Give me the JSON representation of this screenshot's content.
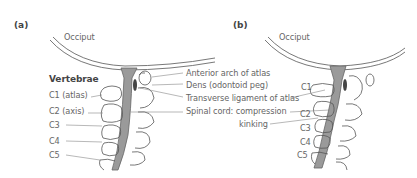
{
  "panels": [
    {
      "id": "a",
      "label": "(a)",
      "occiput": "Occiput",
      "vertebrae_heading": "Vertebrae",
      "vertebrae": [
        "C1 (atlas)",
        "C2 (axis)",
        "C3",
        "C4",
        "C5"
      ],
      "annotations": [
        "Anterior arch of atlas",
        "Dens (odontoid peg)",
        "Transverse ligament of atlas",
        "Spinal cord: compression",
        "kinking"
      ]
    },
    {
      "id": "b",
      "label": "(b)",
      "occiput": "Occiput",
      "vertebrae": [
        "C1",
        "C2",
        "C3",
        "C4",
        "C5"
      ]
    }
  ],
  "colors": {
    "line": "#555555",
    "cord": "#9a9a9a",
    "dens": "#444444",
    "text": "#666666"
  }
}
